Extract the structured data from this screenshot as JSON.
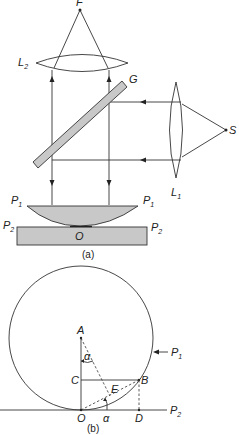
{
  "figure_a": {
    "caption": "(a)",
    "labels": {
      "focus": "F",
      "lens_top": "L",
      "lens_top_sub": "2",
      "glass_plate": "G",
      "source": "S",
      "lens_side": "L",
      "lens_side_sub": "1",
      "plano_convex_left": "P",
      "plano_convex_left_sub": "1",
      "plano_convex_right": "P",
      "plano_convex_right_sub": "1",
      "plate_left": "P",
      "plate_left_sub": "2",
      "plate_right": "P",
      "plate_right_sub": "2",
      "contact_point": "O"
    },
    "colors": {
      "fill": "#c8c8c8",
      "stroke": "#333333"
    }
  },
  "figure_b": {
    "caption": "(b)",
    "labels": {
      "center": "A",
      "point_c": "C",
      "point_b": "B",
      "point_e": "E",
      "point_o": "O",
      "point_d": "D",
      "angle_top": "α",
      "angle_bottom": "α",
      "circle": "P",
      "circle_sub": "1",
      "plane": "P",
      "plane_sub": "2"
    }
  }
}
